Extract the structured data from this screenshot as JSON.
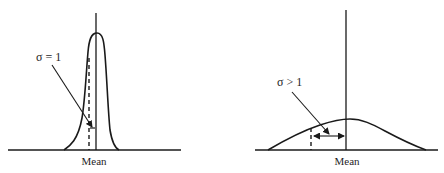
{
  "figure": {
    "panels": [
      {
        "id": "narrow",
        "sigma_label": "σ = 1",
        "mean_label": "Mean",
        "description": "Narrow, tall distribution with small standard deviation"
      },
      {
        "id": "wide",
        "sigma_label": "σ > 1",
        "mean_label": "Mean",
        "description": "Wide, flat distribution with large standard deviation"
      }
    ]
  },
  "colors": {
    "ink": "#1a1a1a",
    "background": "#ffffff"
  }
}
